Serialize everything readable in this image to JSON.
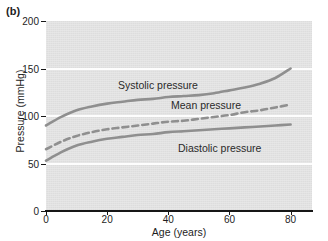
{
  "figure": {
    "panel_label": "(b)"
  },
  "chart_data": {
    "type": "line",
    "title": "",
    "xlabel": "Age (years)",
    "ylabel": "Pressure (mmHg)",
    "xlim": [
      0,
      87
    ],
    "ylim": [
      0,
      200
    ],
    "xticks": [
      0,
      20,
      40,
      60,
      80
    ],
    "xtick_labels": [
      "0",
      "20",
      "40",
      "60",
      "80"
    ],
    "yticks": [
      0,
      50,
      100,
      150,
      200
    ],
    "ytick_labels": [
      "0",
      "50",
      "100",
      "150",
      "200"
    ],
    "grid": "horizontal-white",
    "legend_position": "inline-annotations",
    "background": "#e4e4e4",
    "line_color": "#8f8f8f",
    "series": [
      {
        "name": "Systolic pressure",
        "style": "solid",
        "label": "Systolic pressure",
        "x": [
          0,
          5,
          10,
          15,
          20,
          25,
          30,
          35,
          40,
          45,
          50,
          55,
          60,
          65,
          70,
          75,
          80
        ],
        "values": [
          90,
          99,
          106,
          110,
          113,
          115,
          117,
          118,
          120,
          121,
          122,
          124,
          127,
          130,
          134,
          140,
          150
        ]
      },
      {
        "name": "Mean pressure",
        "style": "dashed",
        "label": "Mean pressure",
        "x": [
          0,
          5,
          10,
          15,
          20,
          25,
          30,
          35,
          40,
          45,
          50,
          55,
          60,
          65,
          70,
          75,
          80
        ],
        "values": [
          65,
          73,
          79,
          83,
          86,
          88,
          90,
          92,
          94,
          95,
          97,
          99,
          101,
          104,
          106,
          109,
          112
        ]
      },
      {
        "name": "Diastolic pressure",
        "style": "solid",
        "label": "Diastolic pressure",
        "x": [
          0,
          5,
          10,
          15,
          20,
          25,
          30,
          35,
          40,
          45,
          50,
          55,
          60,
          65,
          70,
          75,
          80
        ],
        "values": [
          53,
          62,
          69,
          73,
          76,
          78,
          80,
          81,
          83,
          84,
          85,
          86,
          87,
          88,
          89,
          90,
          91
        ]
      }
    ]
  }
}
